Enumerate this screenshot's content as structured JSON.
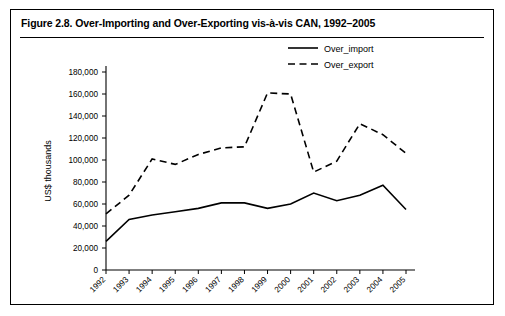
{
  "figure": {
    "title": "Figure 2.8. Over-Importing and Over-Exporting vis-à-vis CAN, 1992–2005"
  },
  "chart_data": {
    "type": "line",
    "title": "Figure 2.8. Over-Importing and Over-Exporting vis-à-vis CAN, 1992–2005",
    "xlabel": "Year",
    "ylabel": "US$ thousands",
    "categories": [
      "1992",
      "1993",
      "1994",
      "1995",
      "1996",
      "1997",
      "1998",
      "1999",
      "2000",
      "2001",
      "2002",
      "2003",
      "2004",
      "2005"
    ],
    "ylim": [
      0,
      180000
    ],
    "yticks": [
      0,
      20000,
      40000,
      60000,
      80000,
      100000,
      120000,
      140000,
      160000,
      180000
    ],
    "ytick_labels": [
      "0",
      "20,000",
      "40,000",
      "60,000",
      "80,000",
      "100,000",
      "120,000",
      "140,000",
      "160,000",
      "180,000"
    ],
    "grid": false,
    "legend_position": "top-right",
    "series": [
      {
        "name": "Over_import",
        "style": "solid",
        "color": "#000000",
        "values": [
          26000,
          46000,
          50000,
          53000,
          56000,
          61000,
          61000,
          56000,
          60000,
          70000,
          63000,
          68000,
          77000,
          55000
        ]
      },
      {
        "name": "Over_export",
        "style": "dashed",
        "color": "#000000",
        "values": [
          51000,
          68000,
          101000,
          96000,
          105000,
          111000,
          112000,
          161000,
          160000,
          89000,
          99000,
          133000,
          123000,
          106000
        ]
      }
    ]
  },
  "legend": {
    "items": [
      {
        "label": "Over_import",
        "style": "solid"
      },
      {
        "label": "Over_export",
        "style": "dashed"
      }
    ]
  }
}
